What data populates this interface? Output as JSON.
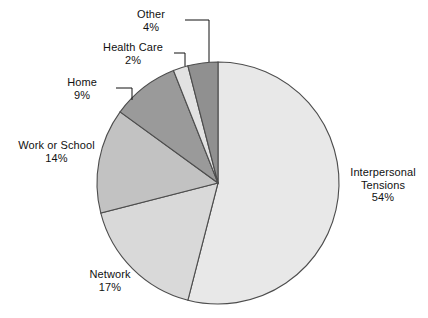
{
  "chart_data": {
    "type": "pie",
    "title": "",
    "subtitle": "",
    "xlabel": "",
    "ylabel": "",
    "legend_position": "none",
    "grid": false,
    "units": "percent",
    "start_angle_deg": 0,
    "direction": "clockwise",
    "categories": [
      "Interpersonal Tensions",
      "Network",
      "Work or School",
      "Home",
      "Health Care",
      "Other"
    ],
    "values": [
      54,
      17,
      14,
      9,
      2,
      4
    ],
    "slices": [
      {
        "label": "Interpersonal Tensions",
        "value": 54,
        "percent_text": "54%",
        "color": "#e8e8e8",
        "label_lines": [
          "Interpersonal",
          "Tensions"
        ],
        "leader_line": false
      },
      {
        "label": "Network",
        "value": 17,
        "percent_text": "17%",
        "color": "#d9d9d9",
        "label_lines": [
          "Network"
        ],
        "leader_line": false
      },
      {
        "label": "Work or School",
        "value": 14,
        "percent_text": "14%",
        "color": "#c2c2c2",
        "label_lines": [
          "Work or School"
        ],
        "leader_line": false
      },
      {
        "label": "Home",
        "value": 9,
        "percent_text": "9%",
        "color": "#9a9a9a",
        "label_lines": [
          "Home"
        ],
        "leader_line": true
      },
      {
        "label": "Health Care",
        "value": 2,
        "percent_text": "2%",
        "color": "#e2e2e2",
        "label_lines": [
          "Health Care"
        ],
        "leader_line": true
      },
      {
        "label": "Other",
        "value": 4,
        "percent_text": "4%",
        "color": "#909090",
        "label_lines": [
          "Other"
        ],
        "leader_line": true
      }
    ],
    "outline_color": "#4d4d4d",
    "background_color": "#ffffff"
  },
  "labels": {
    "other": {
      "name": "Other",
      "pct": "4%"
    },
    "health_care": {
      "name": "Health Care",
      "pct": "2%"
    },
    "home": {
      "name": "Home",
      "pct": "9%"
    },
    "work_or_school": {
      "name": "Work or School",
      "pct": "14%"
    },
    "network": {
      "name": "Network",
      "pct": "17%"
    },
    "interpersonal_line1": "Interpersonal",
    "interpersonal_line2": "Tensions",
    "interpersonal_pct": "54%"
  }
}
